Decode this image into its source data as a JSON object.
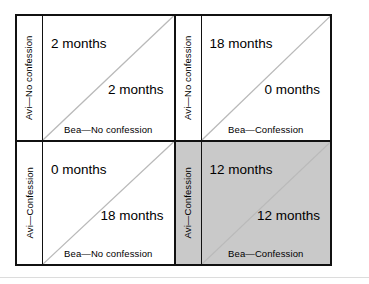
{
  "figure": {
    "type": "payoff-matrix",
    "shaded_cell": "bottom-right",
    "colors": {
      "border": "#111111",
      "shade": "#c9c9c9",
      "diagonal": "#b9b9b9",
      "rule": "#dcdcdc",
      "text": "#000000"
    }
  },
  "cells": {
    "top_left": {
      "row_label": "Avi—No confession",
      "col_label": "Bea—No confession",
      "upper_payoff": "2 months",
      "lower_payoff": "2 months"
    },
    "top_right": {
      "row_label": "Avi—No confession",
      "col_label": "Bea—Confession",
      "upper_payoff": "18 months",
      "lower_payoff": "0 months"
    },
    "bottom_left": {
      "row_label": "Avi—Confession",
      "col_label": "Bea—No confession",
      "upper_payoff": "0 months",
      "lower_payoff": "18 months"
    },
    "bottom_right": {
      "row_label": "Avi—Confession",
      "col_label": "Bea—Confession",
      "upper_payoff": "12 months",
      "lower_payoff": "12 months"
    }
  }
}
